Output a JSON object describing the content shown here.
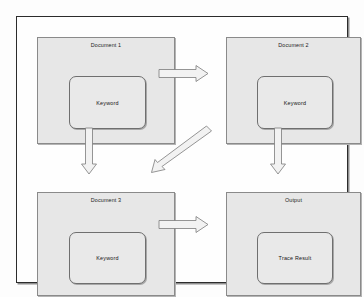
{
  "diagram": {
    "background_color": "#fdfdfd",
    "frame_border_color": "#2c2c2c",
    "panel_fill_color": "#e7e7e7",
    "panel_border_color": "#8a8a8a",
    "arrow_fill_color": "#f2f2f2",
    "arrow_border_color": "#7b7b7b",
    "panels": [
      {
        "id": "document-1",
        "title": "Document 1",
        "inner": {
          "label": "Keyword",
          "shape": "rounded-rectangle"
        }
      },
      {
        "id": "document-2",
        "title": "Document 2",
        "inner": {
          "label": "Keyword",
          "shape": "rounded-rectangle"
        }
      },
      {
        "id": "document-3",
        "title": "Document 3",
        "inner": {
          "label": "Keyword",
          "shape": "rounded-rectangle"
        }
      },
      {
        "id": "output",
        "title": "Output",
        "inner": {
          "label": "Trace Result",
          "shape": "rounded-rectangle"
        }
      }
    ],
    "arrows": [
      {
        "id": "arrow-doc1-to-doc2",
        "from": "document-1",
        "to": "document-2",
        "direction": "right",
        "style": "hollow-block"
      },
      {
        "id": "arrow-doc1-to-doc3",
        "from": "document-1",
        "to": "document-3",
        "direction": "down",
        "style": "hollow-block"
      },
      {
        "id": "arrow-doc2-to-doc3",
        "from": "document-2",
        "to": "document-3",
        "direction": "diagonal-down-left",
        "style": "hollow-block"
      },
      {
        "id": "arrow-doc2-to-output",
        "from": "document-2",
        "to": "output",
        "direction": "down",
        "style": "hollow-block"
      },
      {
        "id": "arrow-doc3-to-output",
        "from": "document-3",
        "to": "output",
        "direction": "right",
        "style": "hollow-block"
      }
    ]
  }
}
